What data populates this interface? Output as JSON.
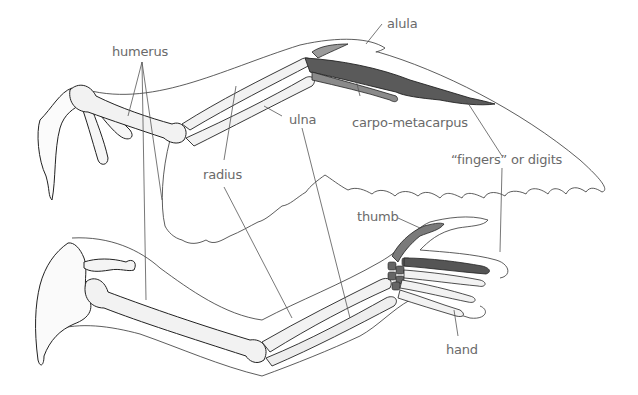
{
  "diagram": {
    "type": "comparative anatomy illustration",
    "subjects": [
      "bird wing skeleton",
      "human arm skeleton"
    ],
    "colors": {
      "label_text": "#6a6a6a",
      "leader_line": "#555555",
      "outline": "#333333",
      "bone_fill": "#f2f2f2",
      "bone_shade": "#d8d8d8",
      "highlight_bone": "#555555"
    },
    "labels": {
      "humerus": "humerus",
      "alula": "alula",
      "ulna": "ulna",
      "carpo_metacarpus": "carpo-metacarpus",
      "radius": "radius",
      "fingers": "“fingers” or digits",
      "thumb": "thumb",
      "hand": "hand"
    }
  }
}
